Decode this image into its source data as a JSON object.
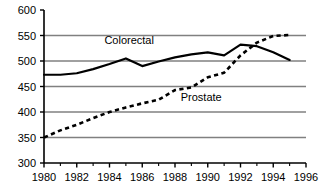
{
  "chart_data": {
    "type": "line",
    "title": "",
    "subtitle": "",
    "xlabel": "",
    "ylabel": "",
    "xlim": [
      1980,
      1996
    ],
    "ylim": [
      300,
      600
    ],
    "xticks": [
      1980,
      1982,
      1984,
      1986,
      1988,
      1990,
      1992,
      1994,
      1996
    ],
    "xtick_labels": [
      "1980",
      "1982",
      "1984",
      "1986",
      "1988",
      "1990",
      "1992",
      "1994",
      "1996"
    ],
    "xminor_ticks": [
      1981,
      1983,
      1985,
      1987,
      1989,
      1991,
      1993,
      1995
    ],
    "yticks": [
      300,
      350,
      400,
      450,
      500,
      550,
      600
    ],
    "ytick_labels": [
      "300",
      "350",
      "400",
      "450",
      "500",
      "550",
      "600"
    ],
    "grid": "horizontal",
    "gridlines": [
      350,
      400,
      450,
      500,
      550
    ],
    "grid_color": "#808080",
    "axis_color": "#000000",
    "legend": "inline-annotation",
    "x": [
      1980,
      1981,
      1982,
      1983,
      1984,
      1985,
      1986,
      1987,
      1988,
      1989,
      1990,
      1991,
      1992,
      1993,
      1994,
      1995
    ],
    "series": [
      {
        "name": "Colorectal",
        "style": "solid",
        "color": "#000000",
        "label_x": 1985.2,
        "label_y": 534,
        "values": [
          473,
          473,
          476,
          484,
          494,
          505,
          490,
          499,
          507,
          513,
          517,
          511,
          532,
          529,
          517,
          502
        ]
      },
      {
        "name": "Prostate",
        "style": "dashed",
        "color": "#000000",
        "label_x": 1989.6,
        "label_y": 421,
        "values": [
          350,
          364,
          375,
          388,
          400,
          409,
          417,
          424,
          443,
          448,
          468,
          477,
          511,
          536,
          549,
          551
        ]
      }
    ],
    "annotations": [
      {
        "text": "Colorectal",
        "x": 1985.2,
        "y": 534
      },
      {
        "text": "Prostate",
        "x": 1989.6,
        "y": 421
      }
    ]
  },
  "geometry": {
    "plot_left": 44,
    "plot_right": 306,
    "plot_top": 10,
    "plot_bottom": 163
  }
}
